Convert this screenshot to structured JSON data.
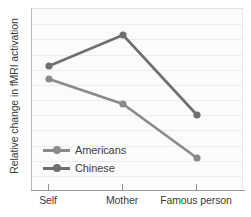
{
  "chart_data": {
    "type": "line",
    "title": "",
    "xlabel": "",
    "ylabel": "Relative change in fMRI activation",
    "categories": [
      "Self",
      "Mother",
      "Famous person"
    ],
    "grid": true,
    "legend_position": "inside-lower-left",
    "ylim": [
      0,
      1
    ],
    "y_axis_ticks": false,
    "series": [
      {
        "name": "Americans",
        "color": "#8a8a8a",
        "values": [
          0.69,
          0.48,
          0.18
        ],
        "points_px": [
          [
            48,
            78
          ],
          [
            122,
            103
          ],
          [
            196,
            157
          ]
        ]
      },
      {
        "name": "Chinese",
        "color": "#6f6f6f",
        "values": [
          0.76,
          0.93,
          0.42
        ],
        "points_px": [
          [
            48,
            65
          ],
          [
            122,
            34
          ],
          [
            196,
            114
          ]
        ]
      }
    ]
  },
  "legend": {
    "items": [
      {
        "label": "Americans",
        "color": "#8a8a8a"
      },
      {
        "label": "Chinese",
        "color": "#6f6f6f"
      }
    ]
  },
  "axes": {
    "y_title": "Relative change in fMRI activation",
    "x_tick_labels": [
      "Self",
      "Mother",
      "Famous person"
    ],
    "x_tick_positions_px": [
      48,
      122,
      196
    ]
  },
  "colors": {
    "americans": "#8a8a8a",
    "chinese": "#6f6f6f",
    "grid": "#ededed",
    "axis": "#9a9a9a",
    "text": "#3c3c3c",
    "plot_background": "#fbfbfb"
  }
}
